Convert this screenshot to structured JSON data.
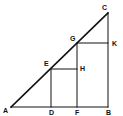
{
  "diagram": {
    "type": "geometry",
    "stroke_color": "#111111",
    "background": "#ffffff",
    "points": {
      "A": {
        "x": 11,
        "y": 107,
        "label": "A"
      },
      "B": {
        "x": 108,
        "y": 107,
        "label": "B"
      },
      "C": {
        "x": 108,
        "y": 13,
        "label": "C"
      },
      "D": {
        "x": 51,
        "y": 107,
        "label": "D"
      },
      "E": {
        "x": 51,
        "y": 69,
        "label": "E"
      },
      "F": {
        "x": 77,
        "y": 107,
        "label": "F"
      },
      "G": {
        "x": 77,
        "y": 43,
        "label": "G"
      },
      "H": {
        "x": 77,
        "y": 69,
        "label": "H"
      },
      "K": {
        "x": 108,
        "y": 43,
        "label": "K"
      }
    },
    "labels": [
      {
        "id": "A",
        "text": "A",
        "x": 3,
        "y": 113
      },
      {
        "id": "D",
        "text": "D",
        "x": 49,
        "y": 115
      },
      {
        "id": "F",
        "text": "F",
        "x": 75,
        "y": 115
      },
      {
        "id": "B",
        "text": "B",
        "x": 106,
        "y": 115
      },
      {
        "id": "C",
        "text": "C",
        "x": 102,
        "y": 10
      },
      {
        "id": "G",
        "text": "G",
        "x": 70,
        "y": 41
      },
      {
        "id": "K",
        "text": "K",
        "x": 112,
        "y": 46
      },
      {
        "id": "E",
        "text": "E",
        "x": 44,
        "y": 66
      },
      {
        "id": "H",
        "text": "H",
        "x": 80,
        "y": 71
      }
    ],
    "segments": [
      {
        "from": "A",
        "to": "C",
        "width": 1.6
      },
      {
        "from": "A",
        "to": "B",
        "width": 1
      },
      {
        "from": "B",
        "to": "C",
        "width": 1
      },
      {
        "from": "E",
        "to": "D",
        "width": 1
      },
      {
        "from": "E",
        "to": "H",
        "width": 1
      },
      {
        "from": "G",
        "to": "F",
        "width": 1
      },
      {
        "from": "G",
        "to": "K",
        "width": 1
      }
    ]
  }
}
